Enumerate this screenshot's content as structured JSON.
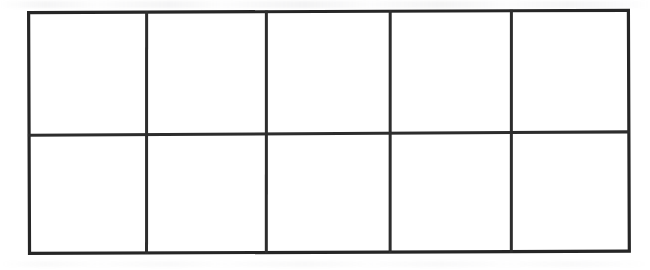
{
  "document": {
    "kind": "scanned-worksheet",
    "title": "",
    "background_color": "#ffffff"
  },
  "grid": {
    "name": "blank-grid-table",
    "columns": 5,
    "rows": 2,
    "total_cells": 10,
    "border_color": "#262626",
    "inner_line_color": "#2d2d2d",
    "outer_border_width_px": 3,
    "inner_line_width_px": 3,
    "cell_fill": "#ffffff",
    "bounds": {
      "x": 27,
      "y": 11,
      "width": 603,
      "height": 244
    },
    "vertical_divider_x": [
      146,
      266,
      390,
      511
    ],
    "horizontal_divider_y": [
      134
    ],
    "column_headers": [
      "",
      "",
      "",
      "",
      ""
    ],
    "rows_data": [
      {
        "cells": [
          "",
          "",
          "",
          "",
          ""
        ]
      },
      {
        "cells": [
          "",
          "",
          "",
          "",
          ""
        ]
      }
    ]
  },
  "artifacts": {
    "noise_label": "scan-speckle",
    "ghost_label": "scan-ghost-band"
  }
}
